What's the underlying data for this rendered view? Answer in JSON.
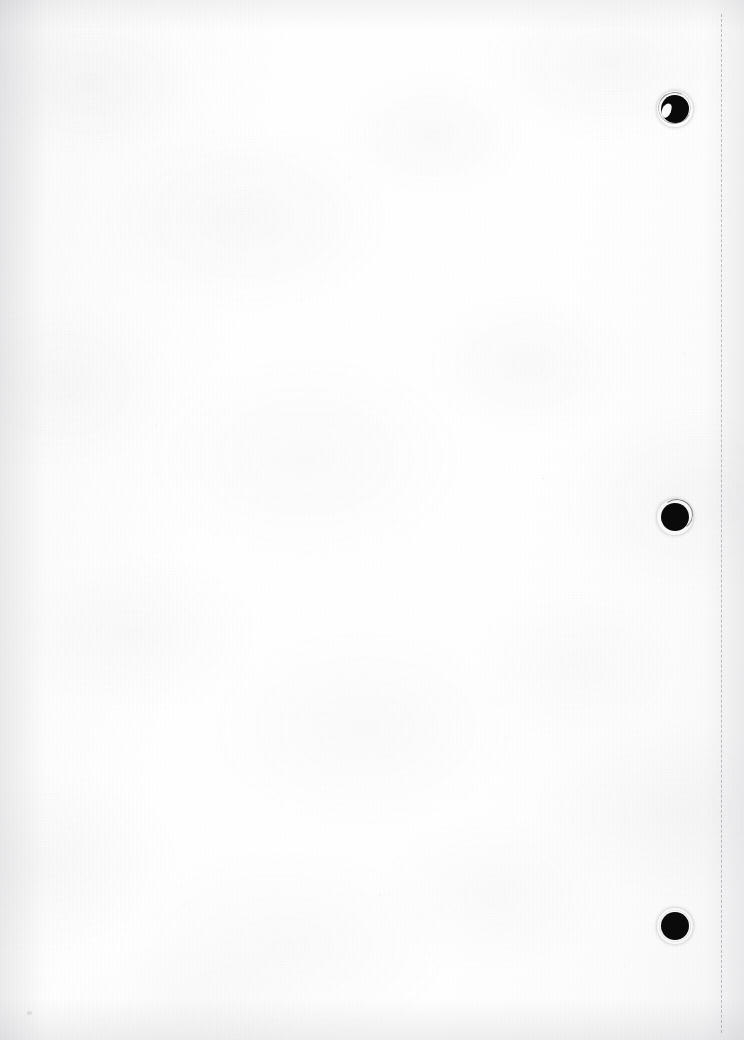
{
  "document": {
    "kind": "scanned-page",
    "orientation": "portrait",
    "width_px": 744,
    "height_px": 1040,
    "text_content": "",
    "content_note": "Blank page — no printed text, headings, figures or page number visible.",
    "paper_color": "#fdfdfd",
    "ink_color": "#0a0a0a"
  },
  "perforation": {
    "name": "dashed-fold-line",
    "orientation": "vertical",
    "x_px": 721,
    "top_px": 14,
    "bottom_px": 1033,
    "color": "#787882",
    "dash_length_px": 12,
    "gap_length_px": 9,
    "stroke_width_px": 1
  },
  "punch_holes": [
    {
      "label": "top-hole",
      "center_x": 675,
      "center_y": 109,
      "radius_px": 14,
      "color": "#0a0a0a",
      "condition": "torn edge with white crescent notch at lower-left"
    },
    {
      "label": "middle-hole",
      "center_x": 675,
      "center_y": 517,
      "radius_px": 14,
      "color": "#0a0a0a",
      "condition": "thin dark tear arc across upper-right rim"
    },
    {
      "label": "bottom-hole",
      "center_x": 675,
      "center_y": 926,
      "radius_px": 14,
      "color": "#0a0a0a",
      "condition": "clean round edge"
    }
  ],
  "artifacts": [
    {
      "label": "stray-speck",
      "x": 27,
      "y": 1011,
      "width": 5,
      "height": 4
    }
  ]
}
